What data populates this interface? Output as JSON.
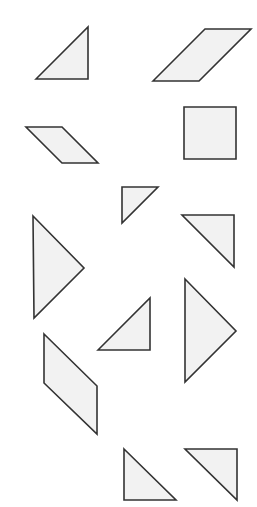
{
  "canvas": {
    "width": 257,
    "height": 507,
    "background": "#ffffff"
  },
  "style": {
    "fill": "#f2f2f2",
    "stroke": "#333333"
  },
  "shapes": [
    {
      "id": "triangle-1",
      "kind": "triangle",
      "points": "36,79 88,27 88,79"
    },
    {
      "id": "parallelogram-1",
      "kind": "parallelogram",
      "points": "153,81 205,29 251,29 199,81"
    },
    {
      "id": "parallelogram-2",
      "kind": "parallelogram",
      "points": "26,127 62,127 98,163 62,163"
    },
    {
      "id": "square-1",
      "kind": "square",
      "points": "184,107 236,107 236,159 184,159"
    },
    {
      "id": "triangle-2",
      "kind": "triangle",
      "points": "122,187 158,187 122,223"
    },
    {
      "id": "triangle-3",
      "kind": "triangle",
      "points": "182,215 234,215 234,267"
    },
    {
      "id": "triangle-4",
      "kind": "triangle",
      "points": "33,216 84,268 34,318"
    },
    {
      "id": "triangle-5",
      "kind": "triangle",
      "points": "98,350 150,298 150,350"
    },
    {
      "id": "triangle-6",
      "kind": "triangle",
      "points": "185,279 236,331 185,382"
    },
    {
      "id": "parallelogram-3",
      "kind": "parallelogram",
      "points": "44,334 97,386 97,434 44,383"
    },
    {
      "id": "triangle-7",
      "kind": "triangle",
      "points": "124,449 176,500 124,500"
    },
    {
      "id": "triangle-8",
      "kind": "triangle",
      "points": "185,449 237,449 237,500"
    }
  ]
}
